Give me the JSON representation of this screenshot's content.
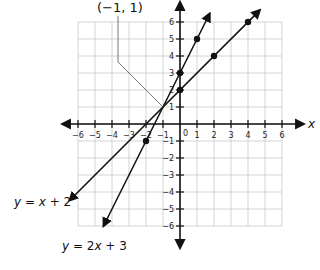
{
  "chart_data": {
    "type": "line",
    "title": "",
    "xlabel": "x",
    "ylabel": "",
    "xlim": [
      -6,
      6
    ],
    "ylim": [
      -6,
      6
    ],
    "grid": true,
    "x_ticks": [
      -6,
      -5,
      -4,
      -3,
      -2,
      -1,
      1,
      2,
      3,
      4,
      5,
      6
    ],
    "y_ticks": [
      -6,
      -5,
      -4,
      -3,
      -2,
      -1,
      1,
      2,
      3,
      4,
      5,
      6
    ],
    "origin_label": "0",
    "series": [
      {
        "name": "y = 2x + 3",
        "label_parts": [
          "y",
          " = 2",
          "x",
          " + 3"
        ],
        "slope": 2,
        "intercept": 3,
        "points": [
          [
            -2,
            -1
          ],
          [
            0,
            3
          ],
          [
            1,
            5
          ]
        ],
        "extent": [
          -4.5,
          1.75
        ]
      },
      {
        "name": "y = x + 2",
        "label_parts": [
          "y",
          " = ",
          "x",
          " + 2"
        ],
        "slope": 1,
        "intercept": 2,
        "points": [
          [
            0,
            2
          ],
          [
            2,
            4
          ],
          [
            4,
            6
          ]
        ],
        "extent": [
          -6.5,
          4.7
        ]
      }
    ],
    "annotations": [
      {
        "text": "(−1, 1)",
        "point": [
          -1,
          1
        ]
      }
    ]
  }
}
